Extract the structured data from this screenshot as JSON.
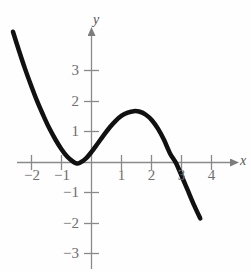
{
  "figure": {
    "background_color": "#fefefe",
    "axis_color": "#8a8a8a",
    "curve_color": "#111111",
    "label_color": "#6e6e6e"
  },
  "axes": {
    "x_axis_label": "x",
    "y_axis_label": "y",
    "x_ticks": [
      {
        "value": -2,
        "label": "−2"
      },
      {
        "value": -1,
        "label": "−1"
      },
      {
        "value": 1,
        "label": "1"
      },
      {
        "value": 2,
        "label": "2"
      },
      {
        "value": 3,
        "label": "3"
      },
      {
        "value": 4,
        "label": "4"
      }
    ],
    "y_ticks": [
      {
        "value": 3,
        "label": "3"
      },
      {
        "value": 2,
        "label": "2"
      },
      {
        "value": 1,
        "label": "1"
      },
      {
        "value": -1,
        "label": "−1"
      },
      {
        "value": -2,
        "label": "−2"
      },
      {
        "value": -3,
        "label": "−3"
      }
    ]
  },
  "chart_data": {
    "type": "line",
    "title": "",
    "subtitle": "",
    "xlabel": "x",
    "ylabel": "y",
    "xlim": [
      -2.9,
      5.2
    ],
    "ylim": [
      -3.5,
      4.7
    ],
    "grid": false,
    "legend": null,
    "xticks": [
      -2,
      -1,
      1,
      2,
      3,
      4
    ],
    "xticklabels": [
      "−2",
      "−1",
      "1",
      "2",
      "3",
      "4"
    ],
    "yticks": [
      3,
      2,
      1,
      -1,
      -2,
      -3
    ],
    "yticklabels": [
      "3",
      "2",
      "1",
      "−1",
      "−2",
      "−3"
    ],
    "annotations": [
      {
        "text": "local minimum",
        "x": -0.5,
        "y": -0.05
      },
      {
        "text": "local maximum",
        "x": 1.6,
        "y": 1.65
      },
      {
        "text": "x-intercept",
        "x": 2.8,
        "y": 0
      }
    ],
    "series": [
      {
        "name": "curve",
        "color": "#111111",
        "linewidth": 4.5,
        "x": [
          -2.6,
          -2.4,
          -2.2,
          -2.0,
          -1.8,
          -1.6,
          -1.4,
          -1.2,
          -1.0,
          -0.8,
          -0.6,
          -0.5,
          -0.4,
          -0.2,
          0.0,
          0.2,
          0.4,
          0.6,
          0.8,
          1.0,
          1.2,
          1.4,
          1.6,
          1.8,
          2.0,
          2.2,
          2.4,
          2.6,
          2.8,
          3.0,
          3.2,
          3.4,
          3.6
        ],
        "y": [
          4.33,
          3.7,
          3.1,
          2.55,
          2.03,
          1.57,
          1.14,
          0.77,
          0.45,
          0.19,
          0.02,
          -0.03,
          -0.02,
          0.12,
          0.35,
          0.62,
          0.9,
          1.16,
          1.38,
          1.55,
          1.65,
          1.7,
          1.68,
          1.58,
          1.4,
          1.12,
          0.75,
          0.3,
          -0.02,
          -0.48,
          -0.95,
          -1.42,
          -1.85
        ]
      }
    ]
  }
}
